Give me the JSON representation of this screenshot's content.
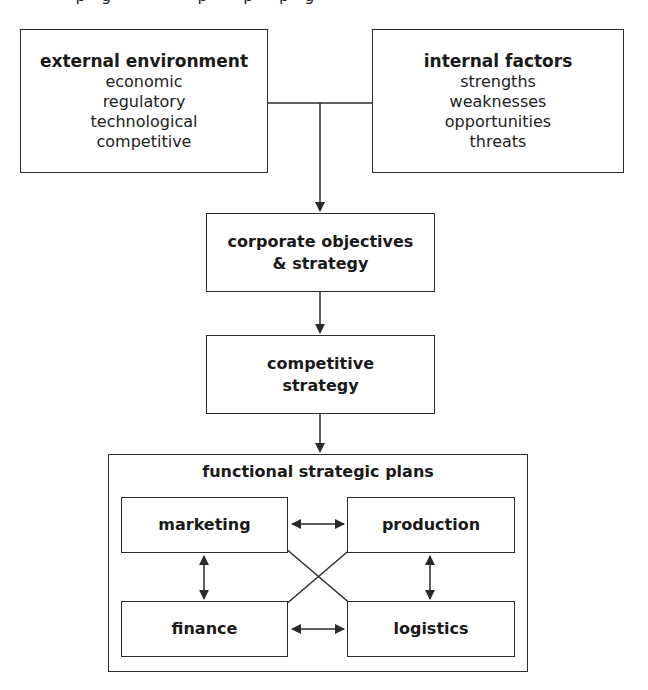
{
  "page": {
    "cut_off_top_text": "· · · p · g · · · · · · · · p · · · p · · p · g · ·"
  },
  "diagram": {
    "external_environment": {
      "title": "external environment",
      "items": [
        "economic",
        "regulatory",
        "technological",
        "competitive"
      ]
    },
    "internal_factors": {
      "title": "internal factors",
      "items": [
        "strengths",
        "weaknesses",
        "opportunities",
        "threats"
      ]
    },
    "corporate": {
      "line1": "corporate objectives",
      "line2": "& strategy"
    },
    "competitive": {
      "line1": "competitive",
      "line2": "strategy"
    },
    "functional": {
      "title": "functional strategic plans",
      "marketing": "marketing",
      "production": "production",
      "finance": "finance",
      "logistics": "logistics"
    },
    "connections": [
      {
        "from": "external environment",
        "to": "corporate objectives & strategy",
        "type": "merge-arrow"
      },
      {
        "from": "internal factors",
        "to": "corporate objectives & strategy",
        "type": "merge-arrow"
      },
      {
        "from": "corporate objectives & strategy",
        "to": "competitive strategy",
        "type": "arrow"
      },
      {
        "from": "competitive strategy",
        "to": "functional strategic plans",
        "type": "arrow"
      },
      {
        "from": "marketing",
        "to": "production",
        "type": "bidirectional"
      },
      {
        "from": "finance",
        "to": "logistics",
        "type": "bidirectional"
      },
      {
        "from": "marketing",
        "to": "finance",
        "type": "bidirectional"
      },
      {
        "from": "production",
        "to": "logistics",
        "type": "bidirectional"
      },
      {
        "from": "marketing",
        "to": "logistics",
        "type": "bidirectional"
      },
      {
        "from": "production",
        "to": "finance",
        "type": "bidirectional"
      }
    ],
    "colors": {
      "line": "#2b2b2b",
      "background": "#ffffff",
      "text": "#1a1a1a"
    }
  }
}
